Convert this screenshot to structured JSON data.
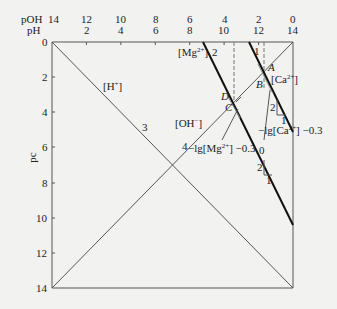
{
  "axes": {
    "top_axis_label_poh": "pOH",
    "top_axis_label_ph": "pH",
    "left_axis_label": "pc",
    "poh_ticks": [
      "14",
      "12",
      "10",
      "8",
      "6",
      "4",
      "2",
      "0"
    ],
    "ph_ticks": [
      "0",
      "2",
      "4",
      "6",
      "8",
      "10",
      "12",
      "14"
    ],
    "pc_ticks": [
      "0",
      "2",
      "4",
      "6",
      "8",
      "10",
      "12",
      "14"
    ]
  },
  "lines": {
    "h_label": "[H",
    "h_sup": "+",
    "h_close": "]",
    "h_number": "3",
    "oh_label": "[OH",
    "oh_sup": "−",
    "oh_close": "]",
    "oh_number": "4",
    "mg_label": "[Mg",
    "mg_sup": "2+",
    "mg_close": "]",
    "mg_number": "2",
    "ca_label": "[Ca",
    "ca_sup": "2+",
    "ca_close": "]",
    "ca_number": "1"
  },
  "points": {
    "A": "A",
    "B": "B",
    "C": "C",
    "D": "D"
  },
  "annotations": {
    "mg_intercept_prefix": "−lg[Mg",
    "mg_intercept_sup": "2+",
    "mg_intercept_suffix": "] −0.3",
    "mg_zero": "0",
    "ca_intercept_prefix": "−lg[Ca",
    "ca_intercept_sup": "2+",
    "ca_intercept_suffix": "] −0.3",
    "slope_rise": "2",
    "slope_run": "1"
  },
  "colors": {
    "ink": "#222222",
    "paper": "#f2f2f0"
  }
}
